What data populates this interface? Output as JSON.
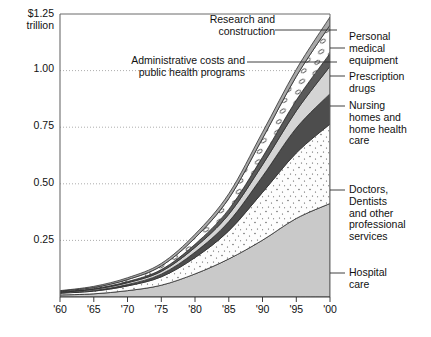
{
  "chart_data": {
    "type": "area",
    "title": "",
    "subtitle": "",
    "xlabel": "",
    "ylabel": "",
    "y_unit_label": "$1.25\ntrillion",
    "stacked": true,
    "grid": true,
    "legend_position": "callouts",
    "x": [
      1960,
      1965,
      1970,
      1975,
      1980,
      1985,
      1990,
      1995,
      2000
    ],
    "x_tick_labels": [
      "'60",
      "'65",
      "'70",
      "'75",
      "'80",
      "'85",
      "'90",
      "'95",
      "'00"
    ],
    "xlim": [
      1960,
      2000
    ],
    "ylim": [
      0,
      1.25
    ],
    "y_ticks": [
      0.25,
      0.5,
      0.75,
      1.0,
      1.25
    ],
    "y_tick_labels": [
      "0.25",
      "0.50",
      "0.75",
      "1.00",
      "1.25"
    ],
    "series": [
      {
        "name": "Hospital care",
        "fill": "#c9c9c9",
        "texture": "solid",
        "values": [
          0.009,
          0.014,
          0.028,
          0.052,
          0.102,
          0.168,
          0.251,
          0.347,
          0.413
        ]
      },
      {
        "name": "Doctors, Dentists and other professional services",
        "fill": "#fdfdfd",
        "texture": "stipple",
        "values": [
          0.008,
          0.012,
          0.021,
          0.037,
          0.072,
          0.124,
          0.211,
          0.289,
          0.351
        ]
      },
      {
        "name": "Nursing homes and home health care",
        "fill": "#4d4d4d",
        "texture": "solid",
        "values": [
          0.001,
          0.003,
          0.006,
          0.012,
          0.024,
          0.041,
          0.071,
          0.11,
          0.134
        ]
      },
      {
        "name": "Prescription drugs",
        "fill": "#d4d4d4",
        "texture": "solid",
        "values": [
          0.003,
          0.005,
          0.008,
          0.012,
          0.021,
          0.032,
          0.051,
          0.076,
          0.121
        ]
      },
      {
        "name": "Personal medical equipment",
        "fill": "#5a5a5a",
        "texture": "solid",
        "values": [
          0.002,
          0.003,
          0.005,
          0.008,
          0.014,
          0.022,
          0.034,
          0.047,
          0.057
        ]
      },
      {
        "name": "Administrative costs and public health programs",
        "fill": "#ffffff",
        "texture": "bubbles",
        "values": [
          0.003,
          0.005,
          0.009,
          0.016,
          0.028,
          0.048,
          0.082,
          0.105,
          0.125
        ]
      },
      {
        "name": "Research and construction",
        "fill": "#a8a8a8",
        "texture": "solid",
        "values": [
          0.002,
          0.005,
          0.008,
          0.011,
          0.016,
          0.021,
          0.028,
          0.031,
          0.036
        ]
      }
    ],
    "callouts": [
      {
        "key": "research",
        "label": "Research and\nconstruction",
        "side": "top"
      },
      {
        "key": "admin",
        "label": "Administrative costs and\npublic health programs",
        "side": "top"
      },
      {
        "key": "equipment",
        "label": "Personal\nmedical\nequipment",
        "side": "right"
      },
      {
        "key": "drugs",
        "label": "Prescription\ndrugs",
        "side": "right"
      },
      {
        "key": "nursing",
        "label": "Nursing\nhomes and\nhome health\ncare",
        "side": "right"
      },
      {
        "key": "doctors",
        "label": "Doctors,\nDentists\nand other\nprofessional\nservices",
        "side": "right"
      },
      {
        "key": "hospital",
        "label": "Hospital\ncare",
        "side": "right"
      }
    ]
  }
}
